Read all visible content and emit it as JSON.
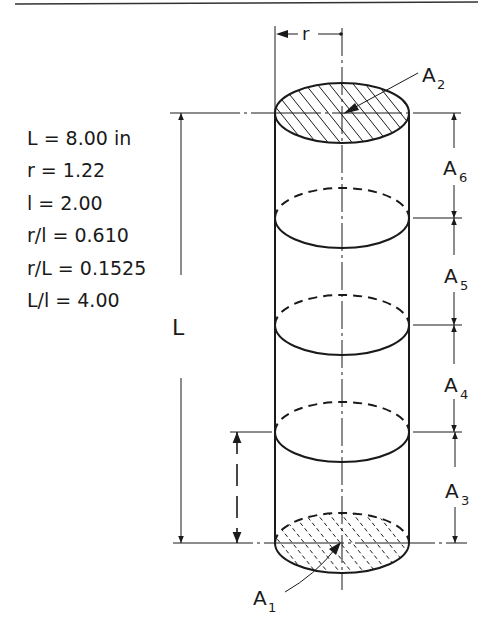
{
  "diagram": {
    "type": "cylinder-dimension-drawing",
    "parameters": [
      {
        "label": "L = 8.00 in"
      },
      {
        "label": "r = 1.22"
      },
      {
        "label": "l = 2.00"
      },
      {
        "label": "r/l = 0.610"
      },
      {
        "label": "r/L = 0.1525"
      },
      {
        "label": "L/l = 4.00"
      }
    ],
    "dimension_labels": {
      "radius": "r",
      "length": "L",
      "segment": "l"
    },
    "area_labels": [
      {
        "base": "A",
        "sub": "2",
        "desc": "top end face (hatched)"
      },
      {
        "base": "A",
        "sub": "6",
        "desc": "top segment"
      },
      {
        "base": "A",
        "sub": "5",
        "desc": "segment"
      },
      {
        "base": "A",
        "sub": "4",
        "desc": "segment"
      },
      {
        "base": "A",
        "sub": "3",
        "desc": "bottom segment"
      },
      {
        "base": "A",
        "sub": "1",
        "desc": "bottom end face (dashed hatch)"
      }
    ],
    "colors": {
      "ink": "#1a1a1a",
      "paper": "#ffffff"
    }
  }
}
